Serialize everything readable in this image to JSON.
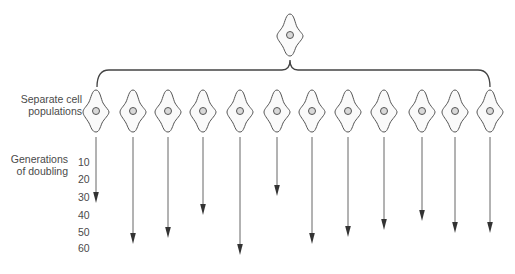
{
  "labels": {
    "populations_line1": "Separate cell",
    "populations_line2": "populations",
    "generations_line1": "Generations",
    "generations_line2": "of doubling"
  },
  "axis": {
    "ticks": [
      "10",
      "20",
      "30",
      "40",
      "50",
      "60"
    ],
    "tick_y": [
      163,
      180,
      198,
      216,
      233,
      249
    ]
  },
  "diagram": {
    "parent_cell": {
      "x": 290,
      "y": 35
    },
    "bracket": {
      "left": 97,
      "right": 490,
      "y": 70,
      "apex_x": 290
    },
    "populations": [
      {
        "x": 96,
        "generations": 30
      },
      {
        "x": 133,
        "generations": 53
      },
      {
        "x": 168,
        "generations": 51
      },
      {
        "x": 203,
        "generations": 39
      },
      {
        "x": 240,
        "generations": 58
      },
      {
        "x": 277,
        "generations": 28
      },
      {
        "x": 312,
        "generations": 53
      },
      {
        "x": 348,
        "generations": 49
      },
      {
        "x": 384,
        "generations": 45
      },
      {
        "x": 422,
        "generations": 41
      },
      {
        "x": 455,
        "generations": 47
      },
      {
        "x": 490,
        "generations": 47
      }
    ],
    "arrow_tips_y": [
      203,
      244,
      238,
      215,
      255,
      196,
      244,
      237,
      230,
      221,
      233,
      233
    ],
    "colors": {
      "line": "#444444",
      "cell_outline": "#555555",
      "arrow": "#333333"
    }
  }
}
